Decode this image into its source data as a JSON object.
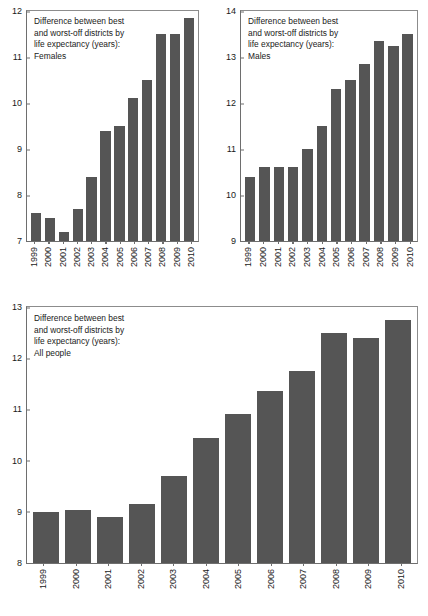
{
  "figure": {
    "background": "#ffffff",
    "bar_color": "#555555",
    "axis_color": "#6e6e6e",
    "text_color": "#1a1a1a"
  },
  "chart_data": [
    {
      "id": "females",
      "type": "bar",
      "title": "Difference between best\nand worst-off districts by\nlife expectancy (years):\nFemales",
      "title_lines": [
        "Difference between best",
        "and worst-off districts by",
        "life expectancy (years):",
        "Females"
      ],
      "xlabel": "",
      "ylabel": "",
      "ylim": [
        7,
        12
      ],
      "yticks": [
        7,
        8,
        9,
        10,
        11,
        12
      ],
      "ytick_labels": [
        "7",
        "8",
        "9",
        "10",
        "11",
        "12"
      ],
      "grid": false,
      "legend": "none",
      "categories": [
        "1999",
        "2000",
        "2001",
        "2002",
        "2003",
        "2004",
        "2005",
        "2006",
        "2007",
        "2008",
        "2009",
        "2010"
      ],
      "values": [
        7.6,
        7.5,
        7.2,
        7.7,
        8.4,
        9.4,
        9.5,
        10.1,
        10.5,
        11.5,
        11.5,
        11.85
      ]
    },
    {
      "id": "males",
      "type": "bar",
      "title": "Difference between best\nand worst-off districts by\nlife expectancy (years):\nMales",
      "title_lines": [
        "Difference between best",
        "and worst-off districts by",
        "life expectancy (years):",
        "Males"
      ],
      "xlabel": "",
      "ylabel": "",
      "ylim": [
        9,
        14
      ],
      "yticks": [
        9,
        10,
        11,
        12,
        13,
        14
      ],
      "ytick_labels": [
        "9",
        "10",
        "11",
        "12",
        "13",
        "14"
      ],
      "grid": false,
      "legend": "none",
      "categories": [
        "1999",
        "2000",
        "2001",
        "2002",
        "2003",
        "2004",
        "2005",
        "2006",
        "2007",
        "2008",
        "2009",
        "2010"
      ],
      "values": [
        10.4,
        10.6,
        10.6,
        10.6,
        11.0,
        11.5,
        12.3,
        12.5,
        12.85,
        13.35,
        13.25,
        13.5
      ]
    },
    {
      "id": "all-people",
      "type": "bar",
      "title": "Difference between best\nand worst-off districts by\nlife expectancy (years):\nAll people",
      "title_lines": [
        "Difference between best",
        "and worst-off districts by",
        "life expectancy (years):",
        "All people"
      ],
      "xlabel": "",
      "ylabel": "",
      "ylim": [
        8,
        13
      ],
      "yticks": [
        8,
        9,
        10,
        11,
        12,
        13
      ],
      "ytick_labels": [
        "8",
        "9",
        "10",
        "11",
        "12",
        "13"
      ],
      "grid": false,
      "legend": "none",
      "categories": [
        "1999",
        "2000",
        "2001",
        "2002",
        "2003",
        "2004",
        "2005",
        "2006",
        "2007",
        "2008",
        "2009",
        "2010"
      ],
      "values": [
        9.0,
        9.03,
        8.9,
        9.15,
        9.7,
        10.45,
        10.92,
        11.35,
        11.75,
        12.5,
        12.4,
        12.75
      ]
    }
  ]
}
